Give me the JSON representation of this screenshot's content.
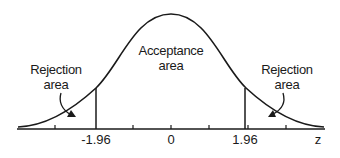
{
  "diagram": {
    "type": "normal-distribution",
    "regions": {
      "left": {
        "line1": "Rejection",
        "line2": "area"
      },
      "center": {
        "line1": "Acceptance",
        "line2": "area"
      },
      "right": {
        "line1": "Rejection",
        "line2": "area"
      }
    },
    "axis": {
      "label": "z",
      "ticks": [
        {
          "value": "-1.96"
        },
        {
          "value": "0"
        },
        {
          "value": "1.96"
        }
      ]
    },
    "critical_values": [
      -1.96,
      1.96
    ],
    "line_color": "#1a1a1a"
  }
}
